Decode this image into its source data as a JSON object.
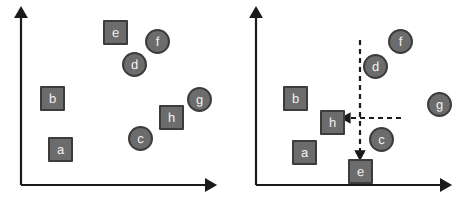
{
  "figure": {
    "title": "",
    "colors": {
      "node_fill": "#6c6c6c",
      "node_border": "#3c3c3c",
      "node_label": "#f2f2f2",
      "axis": "#1a1a1a",
      "dashed_arrow": "#1a1a1a",
      "background": "#ffffff"
    },
    "panels": [
      {
        "id": "left",
        "name": "before-panel",
        "axes": {
          "origin": {
            "x": 21,
            "y": 185
          },
          "x_axis_end": {
            "x": 213,
            "y": 185
          },
          "y_axis_end": {
            "x": 21,
            "y": 11
          },
          "x_label": "",
          "y_label": "",
          "arrowheads": true
        },
        "nodes": [
          {
            "label": "e",
            "shape": "square",
            "x": 103,
            "y": 20
          },
          {
            "label": "f",
            "shape": "circle",
            "x": 145,
            "y": 29
          },
          {
            "label": "d",
            "shape": "circle",
            "x": 122,
            "y": 52
          },
          {
            "label": "b",
            "shape": "square",
            "x": 40,
            "y": 86
          },
          {
            "label": "g",
            "shape": "circle",
            "x": 187,
            "y": 87
          },
          {
            "label": "h",
            "shape": "square",
            "x": 159,
            "y": 105
          },
          {
            "label": "c",
            "shape": "circle",
            "x": 128,
            "y": 126
          },
          {
            "label": "a",
            "shape": "square",
            "x": 48,
            "y": 137
          }
        ],
        "dashed_arrows": []
      },
      {
        "id": "right",
        "name": "after-panel",
        "axes": {
          "origin": {
            "x": 21,
            "y": 185
          },
          "x_axis_end": {
            "x": 213,
            "y": 185
          },
          "y_axis_end": {
            "x": 21,
            "y": 11
          },
          "x_label": "",
          "y_label": "",
          "arrowheads": true
        },
        "nodes": [
          {
            "label": "f",
            "shape": "circle",
            "x": 153,
            "y": 29
          },
          {
            "label": "d",
            "shape": "circle",
            "x": 128,
            "y": 54
          },
          {
            "label": "b",
            "shape": "square",
            "x": 48,
            "y": 86
          },
          {
            "label": "g",
            "shape": "circle",
            "x": 192,
            "y": 92
          },
          {
            "label": "h",
            "shape": "square",
            "x": 85,
            "y": 110
          },
          {
            "label": "c",
            "shape": "circle",
            "x": 134,
            "y": 127
          },
          {
            "label": "a",
            "shape": "square",
            "x": 57,
            "y": 140
          },
          {
            "label": "e",
            "shape": "square",
            "x": 113,
            "y": 159
          }
        ],
        "dashed_arrows": [
          {
            "name": "vertical-dashed-arrow",
            "direction": "down",
            "from": {
              "x": 125,
              "y": 40
            },
            "to": {
              "x": 125,
              "y": 157
            }
          },
          {
            "name": "horizontal-dashed-arrow",
            "direction": "left",
            "from": {
              "x": 166,
              "y": 118
            },
            "to": {
              "x": 109,
              "y": 118
            }
          }
        ]
      }
    ]
  }
}
